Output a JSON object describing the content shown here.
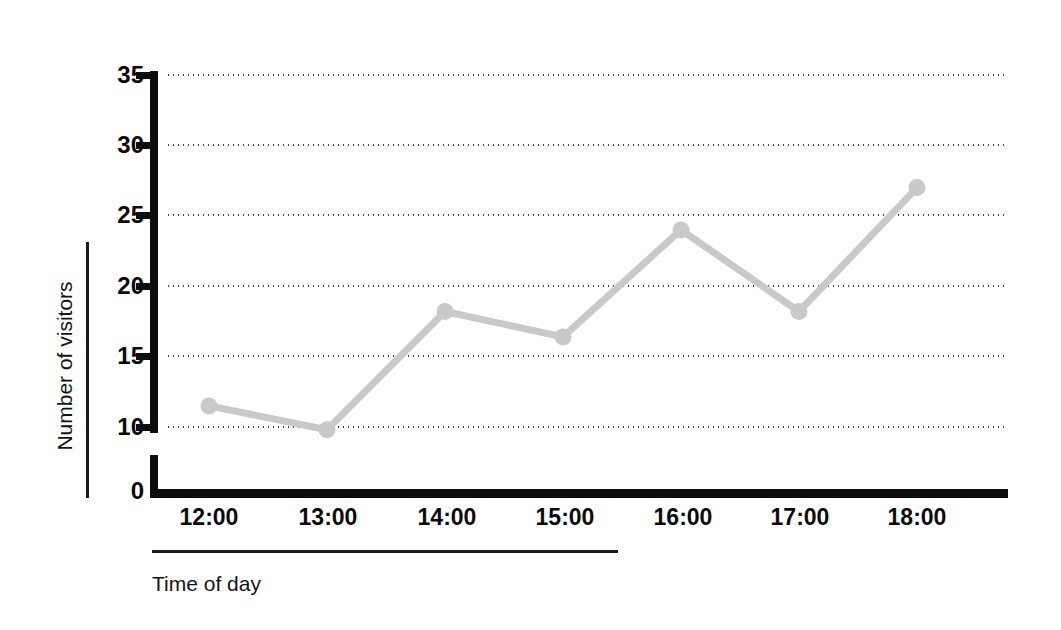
{
  "chart_data": {
    "type": "line",
    "title": "",
    "xlabel": "Time of day",
    "ylabel": "Number of visitors",
    "categories": [
      "12:00",
      "13:00",
      "14:00",
      "15:00",
      "16:00",
      "17:00",
      "18:00"
    ],
    "values": [
      11.5,
      9.8,
      18.2,
      16.4,
      24,
      18.2,
      27
    ],
    "series": [
      {
        "name": "Number of visitors",
        "values": [
          11.5,
          9.8,
          18.2,
          16.4,
          24,
          18.2,
          27
        ]
      }
    ],
    "ylim": [
      0,
      35
    ],
    "y_ticks": [
      0,
      10,
      15,
      20,
      25,
      30,
      35
    ],
    "y_tick_labels": [
      "0",
      "10",
      "15",
      "20",
      "25",
      "30",
      "35"
    ],
    "y_axis_break": true,
    "grid": "horizontal-dotted",
    "legend": "none",
    "line_color": "#c9c9c9",
    "marker_color": "#c9c9c9",
    "marker_shape": "circle",
    "axis_color": "#0d0d0d",
    "grid_color": "#2b2b2b",
    "background_color": "#ffffff"
  },
  "axes": {
    "y_title": "Number of visitors",
    "x_title": "Time of day",
    "y_tick_labels": [
      "35",
      "30",
      "25",
      "20",
      "15",
      "10",
      "0"
    ],
    "x_tick_labels": [
      "12:00",
      "13:00",
      "14:00",
      "15:00",
      "16:00",
      "17:00",
      "18:00"
    ]
  }
}
